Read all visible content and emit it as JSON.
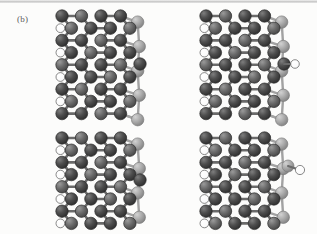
{
  "figure": {
    "panel_label": "(b)",
    "caption_text": "",
    "type": "molecular-structure-grid",
    "n_panels": 4,
    "panel_layout": "2x2",
    "colors": {
      "background": "#fcfcfb",
      "atom_dark": "#4a4a4a",
      "atom_dark_edge": "#2b2b2b",
      "atom_mid": "#6d6d6d",
      "atom_light": "#a9a9a9",
      "atom_light_edge": "#7c7c7c",
      "atom_white": "#ffffff",
      "atom_white_edge": "#5a5a5a",
      "bond_dark": "#6a6a6a",
      "bond_light": "#a2a2a2",
      "top_rule": "#b8b8b8"
    },
    "atom_species": [
      {
        "name": "carbon-dark",
        "color": "#4a4a4a",
        "radius": 6.2
      },
      {
        "name": "carbon-light-edge",
        "color": "#a9a9a9",
        "radius": 6.2
      },
      {
        "name": "hydrogen",
        "color": "#ffffff",
        "radius": 4.3
      }
    ],
    "panels": [
      {
        "id": "panel-top-left",
        "name": "reconstructed-edge-top-left",
        "origin": [
          62,
          16
        ],
        "lattice": {
          "cols": 4,
          "rows": 9,
          "dx": 19.5,
          "dy": 12.2,
          "stagger": 9.4
        },
        "adatom": {
          "present": true,
          "position": [
            140,
            64
          ],
          "species": "carbon-dark",
          "hydrogen": false
        },
        "right_column_species": "carbon-light-edge",
        "left_hydrogens": 4
      },
      {
        "id": "panel-top-right",
        "name": "reconstructed-edge-top-right",
        "origin": [
          206,
          16
        ],
        "lattice": {
          "cols": 4,
          "rows": 9,
          "dx": 19.5,
          "dy": 12.2,
          "stagger": 9.4
        },
        "adatom": {
          "present": true,
          "position": [
            284,
            64
          ],
          "species": "carbon-dark",
          "hydrogen": true
        },
        "right_column_species": "carbon-light-edge",
        "left_hydrogens": 4
      },
      {
        "id": "panel-bottom-left",
        "name": "reconstructed-edge-bottom-left",
        "origin": [
          62,
          138
        ],
        "lattice": {
          "cols": 4,
          "rows": 8,
          "dx": 19.5,
          "dy": 12.2,
          "stagger": 9.4
        },
        "adatom": {
          "present": true,
          "position": [
            140,
            180
          ],
          "species": "carbon-dark",
          "hydrogen": false
        },
        "right_column_species": "carbon-light-edge",
        "left_hydrogens": 4
      },
      {
        "id": "panel-bottom-right",
        "name": "reconstructed-edge-bottom-right",
        "origin": [
          206,
          138
        ],
        "lattice": {
          "cols": 4,
          "rows": 8,
          "dx": 19.5,
          "dy": 12.2,
          "stagger": 9.4
        },
        "adatom": {
          "present": true,
          "position": [
            288,
            166
          ],
          "species": "hydrogen-terminated",
          "hydrogen": true
        },
        "right_column_species": "carbon-light-edge",
        "left_hydrogens": 4
      }
    ]
  }
}
